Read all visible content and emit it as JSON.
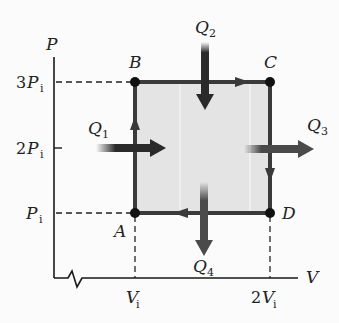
{
  "diagram": {
    "type": "PV diagram (thermodynamic cycle)",
    "axes": {
      "y_label": "P",
      "x_label": "V",
      "y_ticks": [
        {
          "coef": "3",
          "sym": "P",
          "sub": "i"
        },
        {
          "coef": "2",
          "sym": "P",
          "sub": "i"
        },
        {
          "coef": "",
          "sym": "P",
          "sub": "i"
        }
      ],
      "x_ticks": [
        {
          "coef": "",
          "sym": "V",
          "sub": "i"
        },
        {
          "coef": "2",
          "sym": "V",
          "sub": "i"
        }
      ]
    },
    "points": {
      "A": "A",
      "B": "B",
      "C": "C",
      "D": "D"
    },
    "heat_flows": {
      "q1": {
        "sym": "Q",
        "sub": "1",
        "direction": "into system"
      },
      "q2": {
        "sym": "Q",
        "sub": "2",
        "direction": "into system"
      },
      "q3": {
        "sym": "Q",
        "sub": "3",
        "direction": "out of system"
      },
      "q4": {
        "sym": "Q",
        "sub": "4",
        "direction": "out of system"
      }
    },
    "cycle_path": [
      "A",
      "B",
      "C",
      "D",
      "A"
    ],
    "colors": {
      "path": "#3a3a3a",
      "fill": "#e4e4e4",
      "arrow_in": "#2a2a2a",
      "arrow_out": "#4a4a4a",
      "axis": "#1a1a1a"
    }
  }
}
